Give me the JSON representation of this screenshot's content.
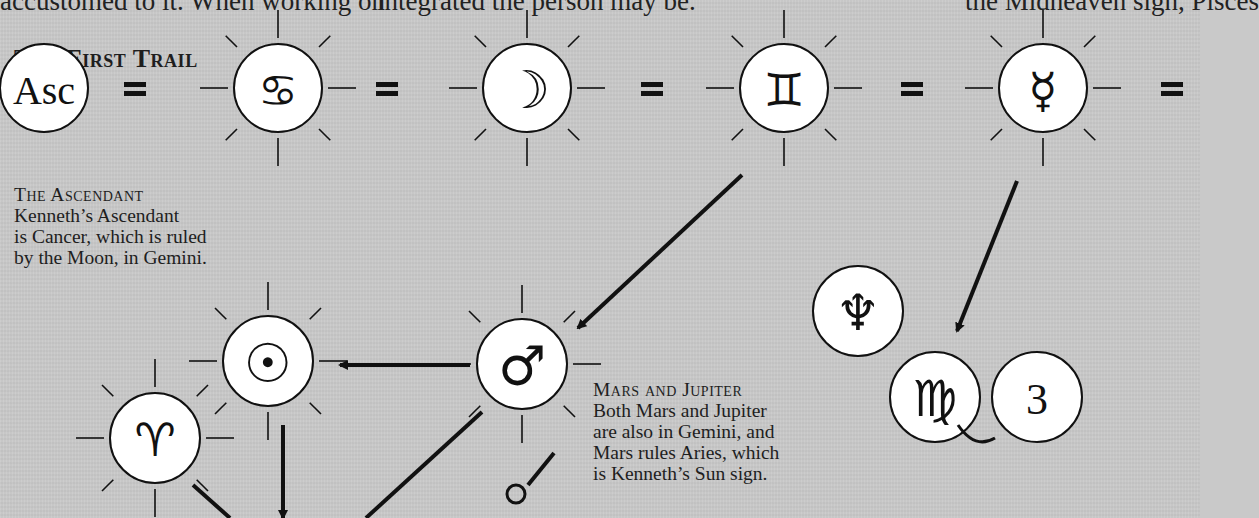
{
  "page": {
    "body_text_fragments": [
      {
        "id": "col1",
        "text": "accustomed to it. When working on",
        "x": 0
      },
      {
        "id": "col2",
        "text": "integrated the person may be.",
        "x": 377
      },
      {
        "id": "col3",
        "text": "the Midheaven sign, Pisces",
        "x": 965
      }
    ],
    "title": "The First Trail"
  },
  "captions": {
    "ascendant": {
      "heading": "The Ascendant",
      "lines": [
        "Kenneth’s Ascendant",
        "is Cancer, which is ruled",
        "by the Moon, in Gemini."
      ]
    },
    "mars_jupiter": {
      "heading": "Mars and Jupiter",
      "lines": [
        "Both Mars and Jupiter",
        "are also in Gemini, and",
        "Mars rules Aries, which",
        "is Kenneth’s Sun sign."
      ]
    }
  },
  "diagram": {
    "colors": {
      "background": "#c9c9c9",
      "circle_fill": "#ffffff",
      "stroke": "#111111"
    },
    "nodes": [
      {
        "id": "ascendant",
        "label": "Asc",
        "glyph_name": "ascendant-text",
        "x": 44,
        "y": 88,
        "r": 44,
        "rays": false,
        "text": true,
        "size": 40
      },
      {
        "id": "cancer",
        "label": "♋",
        "glyph_name": "cancer-icon",
        "x": 278,
        "y": 88,
        "r": 44,
        "rays": true,
        "size": 44
      },
      {
        "id": "moon",
        "label": "☽",
        "glyph_name": "moon-icon",
        "x": 527,
        "y": 88,
        "r": 44,
        "rays": true,
        "size": 52
      },
      {
        "id": "gemini",
        "label": "♊",
        "glyph_name": "gemini-icon",
        "x": 784,
        "y": 88,
        "r": 44,
        "rays": true,
        "size": 46
      },
      {
        "id": "mercury",
        "label": "☿",
        "glyph_name": "mercury-icon",
        "x": 1043,
        "y": 88,
        "r": 44,
        "rays": true,
        "size": 48
      },
      {
        "id": "sun",
        "label": "☉",
        "glyph_name": "sun-icon",
        "x": 268,
        "y": 361,
        "r": 45,
        "rays": true,
        "size": 54
      },
      {
        "id": "mars",
        "label": "♂",
        "glyph_name": "mars-icon",
        "x": 522,
        "y": 364,
        "r": 45,
        "rays": true,
        "size": 54
      },
      {
        "id": "aries",
        "label": "♈",
        "glyph_name": "aries-icon",
        "x": 155,
        "y": 438,
        "r": 45,
        "rays": true,
        "size": 46
      },
      {
        "id": "neptune",
        "label": "♆",
        "glyph_name": "neptune-icon",
        "x": 858,
        "y": 311,
        "r": 45,
        "rays": false,
        "size": 50
      },
      {
        "id": "virgo",
        "label": "♍",
        "glyph_name": "virgo-icon",
        "x": 935,
        "y": 397,
        "r": 45,
        "rays": false,
        "size": 50
      },
      {
        "id": "house3",
        "label": "3",
        "glyph_name": "house-3-text",
        "x": 1037,
        "y": 397,
        "r": 45,
        "rays": false,
        "text": true,
        "size": 44
      }
    ],
    "equals_signs": [
      {
        "x": 135,
        "y": 88
      },
      {
        "x": 387,
        "y": 88
      },
      {
        "x": 652,
        "y": 88
      },
      {
        "x": 912,
        "y": 88
      },
      {
        "x": 1172,
        "y": 88
      }
    ],
    "arrows": [
      {
        "id": "gemini-to-mars",
        "x1": 742,
        "y1": 175,
        "x2": 578,
        "y2": 328
      },
      {
        "id": "mars-to-sun",
        "x1": 470,
        "y1": 365,
        "x2": 340,
        "y2": 365
      },
      {
        "id": "mercury-to-virgo",
        "x1": 1017,
        "y1": 181,
        "x2": 957,
        "y2": 331
      },
      {
        "id": "sun-down",
        "x1": 283,
        "y1": 425,
        "x2": 283,
        "y2": 518
      }
    ],
    "lines": [
      {
        "id": "aries-down-right",
        "x1": 193,
        "y1": 485,
        "x2": 230,
        "y2": 518
      },
      {
        "id": "mars-down-left",
        "x1": 482,
        "y1": 412,
        "x2": 366,
        "y2": 518
      },
      {
        "id": "jupiter-stem",
        "x1": 528,
        "y1": 485,
        "x2": 554,
        "y2": 453
      }
    ],
    "small_circles": [
      {
        "id": "jupiter-ring",
        "x": 516,
        "y": 494,
        "r": 9
      }
    ]
  }
}
